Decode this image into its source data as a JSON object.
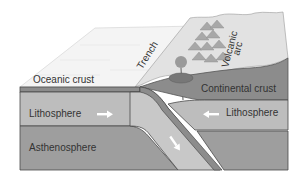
{
  "diagram": {
    "labels": {
      "oceanic_crust": "Oceanic crust",
      "trench": "Trench",
      "volcanic_arc_line1": "Volcanic",
      "volcanic_arc_line2": "arc",
      "continental_crust": "Continental crust",
      "lithosphere_left": "Lithosphere",
      "lithosphere_right": "Lithosphere",
      "asthenosphere": "Asthenosphere"
    },
    "arrows": {
      "left_lithosphere": "right",
      "right_lithosphere": "left",
      "subducting_slab": "down-right"
    },
    "colors": {
      "ocean_surface": "#f4f4f4",
      "land_surface": "#e2e2e2",
      "continental_crust": "#8c8c8c",
      "lithosphere": "#bdbdbd",
      "asthenosphere": "#9e9e9e",
      "slab": "#c8c8c8",
      "outline": "#4a4a4a",
      "mountains": "#a8a8a8",
      "arrow": "#ffffff"
    }
  }
}
